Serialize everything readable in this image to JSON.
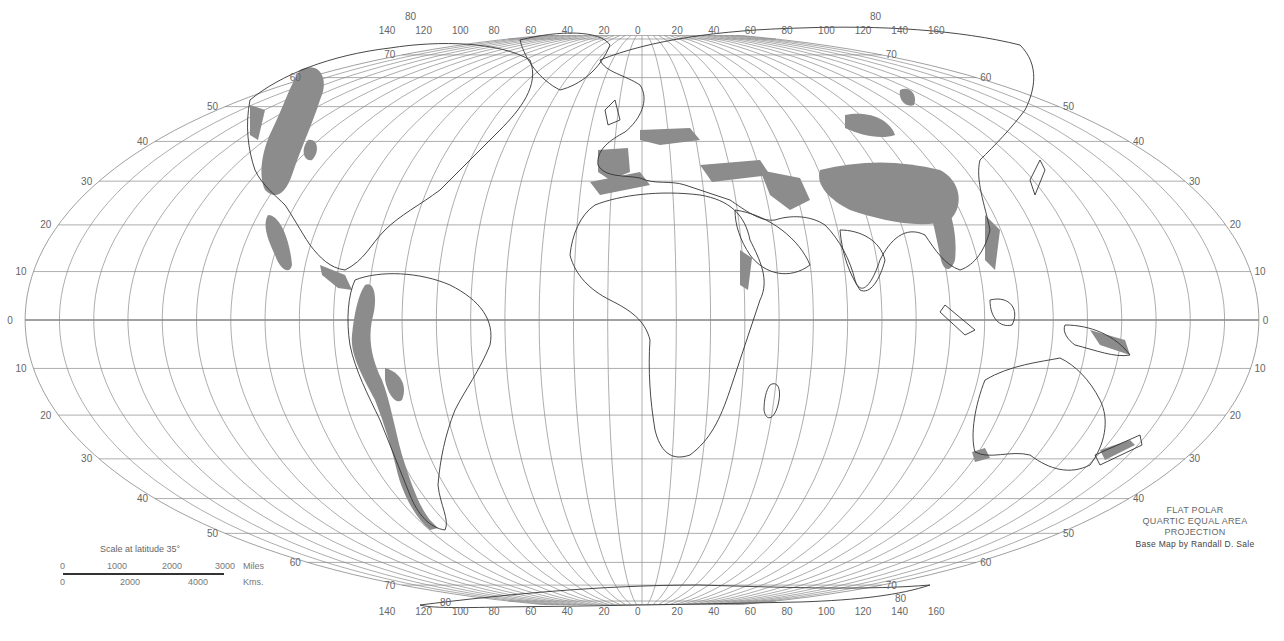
{
  "map": {
    "title_block": {
      "projection_lines": [
        "FLAT POLAR",
        "QUARTIC EQUAL AREA",
        "PROJECTION"
      ],
      "credit": "Base Map by Randall D. Sale"
    },
    "scale": {
      "title": "Scale at latitude 35°",
      "miles_ticks": [
        "0",
        "1000",
        "2000",
        "3000"
      ],
      "miles_unit": "Miles",
      "km_ticks": [
        "0",
        "2000",
        "4000"
      ],
      "km_unit": "Kms."
    },
    "longitude_labels_top": [
      "140",
      "120",
      "100",
      "80",
      "60",
      "40",
      "20",
      "0",
      "20",
      "40",
      "60",
      "80",
      "100",
      "120",
      "140",
      "160"
    ],
    "longitude_labels_bottom": [
      "140",
      "120",
      "100",
      "80",
      "60",
      "40",
      "20",
      "0",
      "20",
      "40",
      "60",
      "80",
      "100",
      "120",
      "140",
      "160"
    ],
    "latitude_labels": [
      "80",
      "70",
      "60",
      "50",
      "40",
      "30",
      "20",
      "10",
      "0",
      "10",
      "20",
      "30",
      "40",
      "50",
      "60",
      "70",
      "80"
    ],
    "colors": {
      "background": "#ffffff",
      "graticule": "#8a8a8a",
      "coastline": "#333333",
      "shaded_region": "#8c8c8c"
    },
    "shaded_regions_description": "Mountain ranges shaded: Rockies/Western Cordillera, Andes, Alps, Pyrenees, Atlas, Caucasus, Zagros, Himalaya/Tibetan Plateau, Tian Shan, Altai, Southeast Asian ranges, East African highlands, New Guinea, New Zealand Alps, SW Australia"
  }
}
